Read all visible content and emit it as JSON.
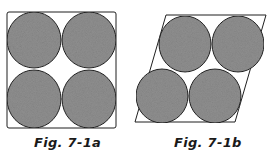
{
  "figures": [
    {
      "id": "7-1a",
      "caption": "Fig. 7-1a",
      "shape": "square",
      "circle_count": 4,
      "arrangement": "2x2 square packing"
    },
    {
      "id": "7-1b",
      "caption": "Fig. 7-1b",
      "shape": "rhombus",
      "circle_count": 4,
      "arrangement": "2x2 hexagonal (staggered) packing"
    }
  ],
  "colors": {
    "circle_fill": "#8f8f8f",
    "outline": "#1f1f1f",
    "background": "#ffffff"
  }
}
